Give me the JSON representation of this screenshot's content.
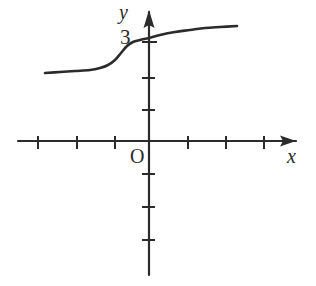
{
  "figure": {
    "kind": "cartesian-graph",
    "width": 316,
    "height": 286,
    "background_color": "#ffffff",
    "stroke_color": "#2b2b2b"
  },
  "labels": {
    "y_axis": "y",
    "x_axis": "x",
    "origin": "O",
    "y_intercept_tick": "3"
  },
  "chart_data": {
    "type": "line",
    "title": "",
    "xlabel": "x",
    "ylabel": "y",
    "grid": false,
    "legend": "none",
    "origin_label": "O",
    "axes": {
      "x_axis_y_pixel": 141,
      "y_axis_x_pixel": 149,
      "x_axis_arrow": "right",
      "y_axis_arrow": "up",
      "x_tick_spacing_px": 38,
      "y_tick_spacing_px": 33,
      "x_ticks_left_px": [
        38,
        77,
        115
      ],
      "x_ticks_right_px": [
        188,
        226,
        264
      ],
      "y_ticks_up_px": [
        42,
        78,
        110
      ],
      "y_ticks_down_px": [
        174,
        207,
        240
      ],
      "labeled_y_ticks": [
        {
          "label": "3",
          "value": 3,
          "y_pixel": 42
        }
      ],
      "xlim": [
        -3.5,
        3.5
      ],
      "ylim": [
        -4.2,
        3.6
      ]
    },
    "curve": {
      "shape": "sigmoid",
      "description": "S-shaped increasing curve with a lower horizontal asymptote on the left, a steep rise just left of the y-axis, passing through the y-axis at y = 3, then flattening toward an upper asymptote on the right",
      "y_intercept": 3,
      "monotonic": "increasing",
      "lower_asymptote_approx": 2,
      "upper_asymptote_approx": 3.5,
      "points_pixel": [
        [
          45,
          73
        ],
        [
          60,
          72
        ],
        [
          75,
          71
        ],
        [
          90,
          70
        ],
        [
          100,
          68
        ],
        [
          108,
          65
        ],
        [
          115,
          60
        ],
        [
          121,
          53
        ],
        [
          127,
          46
        ],
        [
          133,
          42
        ],
        [
          140,
          40
        ],
        [
          149,
          38
        ],
        [
          160,
          35
        ],
        [
          175,
          32
        ],
        [
          190,
          30
        ],
        [
          205,
          28
        ],
        [
          220,
          27
        ],
        [
          237,
          26
        ]
      ],
      "points_data": [
        [
          -2.74,
          2.06
        ],
        [
          -2.34,
          2.09
        ],
        [
          -1.95,
          2.12
        ],
        [
          -1.55,
          2.15
        ],
        [
          -1.29,
          2.21
        ],
        [
          -1.08,
          2.3
        ],
        [
          -0.89,
          2.45
        ],
        [
          -0.74,
          2.67
        ],
        [
          -0.58,
          2.88
        ],
        [
          -0.42,
          3.0
        ],
        [
          -0.24,
          3.06
        ],
        [
          0.0,
          3.12
        ],
        [
          0.29,
          3.21
        ],
        [
          0.68,
          3.3
        ],
        [
          1.08,
          3.36
        ],
        [
          1.47,
          3.42
        ],
        [
          1.87,
          3.45
        ],
        [
          2.32,
          3.48
        ]
      ]
    }
  }
}
